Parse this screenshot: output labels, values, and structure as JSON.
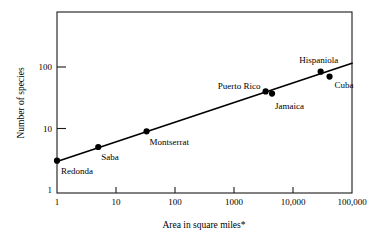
{
  "chart_data": {
    "type": "scatter",
    "title": "",
    "xlabel": "Area in square miles*",
    "ylabel": "Number of species",
    "xscale": "log",
    "yscale": "log",
    "xlim": [
      1,
      100000
    ],
    "ylim": [
      1,
      300
    ],
    "grid": false,
    "legend": "none",
    "xticks": [
      {
        "value": 1,
        "label": "1"
      },
      {
        "value": 10,
        "label": "10"
      },
      {
        "value": 100,
        "label": "100"
      },
      {
        "value": 1000,
        "label": "1000"
      },
      {
        "value": 10000,
        "label": "10,000"
      },
      {
        "value": 100000,
        "label": "100,000"
      }
    ],
    "yticks": [
      {
        "value": 1,
        "label": "1"
      },
      {
        "value": 10,
        "label": "10"
      },
      {
        "value": 100,
        "label": "100"
      }
    ],
    "points": [
      {
        "name": "Redonda",
        "x": 1,
        "y": 3,
        "label_dx": 4,
        "label_dy": 13,
        "label_anchor": "start"
      },
      {
        "name": "Saba",
        "x": 5,
        "y": 5,
        "label_dx": 3,
        "label_dy": 13,
        "label_anchor": "start"
      },
      {
        "name": "Montserrat",
        "x": 33,
        "y": 9,
        "label_dx": 3,
        "label_dy": 14,
        "label_anchor": "start"
      },
      {
        "name": "Puerto Rico",
        "x": 3435,
        "y": 40,
        "label_dx": -5,
        "label_dy": -2,
        "label_anchor": "end"
      },
      {
        "name": "Jamaica",
        "x": 4411,
        "y": 37,
        "label_dx": 3,
        "label_dy": 15,
        "label_anchor": "start"
      },
      {
        "name": "Hispaniola",
        "x": 29418,
        "y": 84,
        "label_dx": -2,
        "label_dy": -9,
        "label_anchor": "middle"
      },
      {
        "name": "Cuba",
        "x": 41634,
        "y": 70,
        "label_dx": 5,
        "label_dy": 11,
        "label_anchor": "start"
      }
    ],
    "trendline": {
      "name": "species-area regression line",
      "x_start": 1,
      "y_start": 2.9,
      "x_end": 100000,
      "y_end": 115
    },
    "footnote_marker": "*"
  },
  "colors": {
    "axis": "#1a1a1a",
    "line": "#000000",
    "point": "#000000",
    "background": "#ffffff"
  }
}
